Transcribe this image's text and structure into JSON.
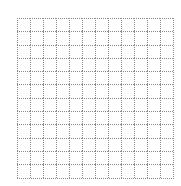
{
  "grid": {
    "rows": 12,
    "cols": 12,
    "cell_width": 13,
    "cell_height": 13.3,
    "line_color": "#8a8a8a",
    "line_style": "dotted",
    "background": "#ffffff"
  }
}
